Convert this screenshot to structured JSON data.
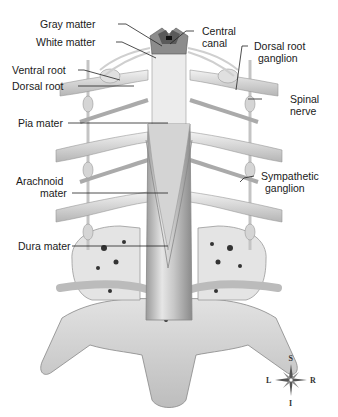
{
  "diagram": {
    "labels_left": [
      {
        "id": "gray-matter",
        "text": "Gray matter"
      },
      {
        "id": "white-matter",
        "text": "White matter"
      },
      {
        "id": "ventral-root",
        "text": "Ventral root"
      },
      {
        "id": "dorsal-root",
        "text": "Dorsal root"
      },
      {
        "id": "pia-mater",
        "text": "Pia mater"
      },
      {
        "id": "arachnoid-mater-1",
        "text": "Arachnoid"
      },
      {
        "id": "arachnoid-mater-2",
        "text": "mater"
      },
      {
        "id": "dura-mater",
        "text": "Dura mater"
      }
    ],
    "labels_right": [
      {
        "id": "central-canal-1",
        "text": "Central"
      },
      {
        "id": "central-canal-2",
        "text": "canal"
      },
      {
        "id": "dorsal-root-ganglion-1",
        "text": "Dorsal root"
      },
      {
        "id": "dorsal-root-ganglion-2",
        "text": "ganglion"
      },
      {
        "id": "spinal-nerve-1",
        "text": "Spinal"
      },
      {
        "id": "spinal-nerve-2",
        "text": "nerve"
      },
      {
        "id": "sympathetic-ganglion-1",
        "text": "Sympathetic"
      },
      {
        "id": "sympathetic-ganglion-2",
        "text": "ganglion"
      }
    ],
    "compass": {
      "top": "S",
      "bottom": "I",
      "left": "L",
      "right": "R"
    },
    "colors": {
      "gray_matter": "#5a5a5a",
      "white_matter": "#8c8c8c",
      "tissue": "#d9d9d9",
      "shadow": "#a8a8a8",
      "line": "#222222"
    }
  }
}
